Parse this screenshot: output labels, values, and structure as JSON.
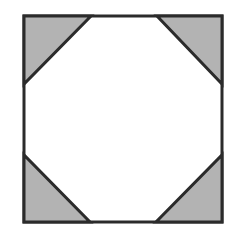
{
  "diagram": {
    "colors": {
      "stroke": "#2b2b2b",
      "shade": "#b3b3b3",
      "background": "#ffffff"
    },
    "square": {
      "x1": 24,
      "y1": 16,
      "x2": 222,
      "y2": 222
    },
    "corner_triangles": [
      {
        "name": "top-left",
        "points": "24,16 91,16 24,84"
      },
      {
        "name": "top-right",
        "points": "157,16 222,16 222,84"
      },
      {
        "name": "bottom-left",
        "points": "24,155 24,222 90,222"
      },
      {
        "name": "bottom-right",
        "points": "222,155 222,222 156,222"
      }
    ]
  }
}
